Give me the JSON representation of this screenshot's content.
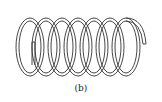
{
  "figure": {
    "caption": "(b)",
    "turns": 7,
    "stroke_color": "#333333",
    "background": "#ffffff"
  }
}
